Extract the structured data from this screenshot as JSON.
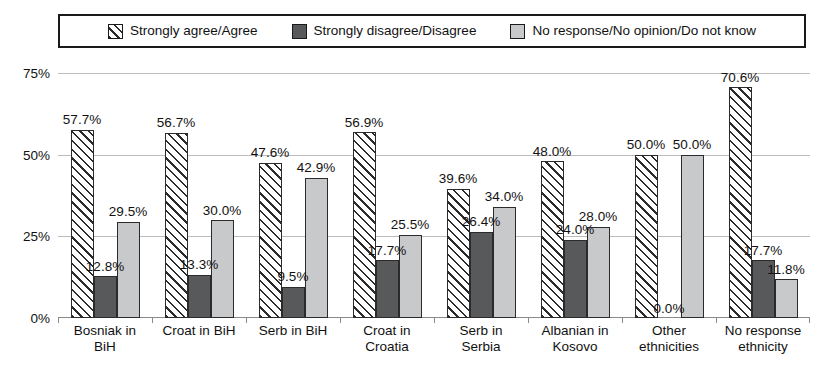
{
  "legend": {
    "items": [
      {
        "label": "Strongly agree/Agree",
        "swatch": "hatch-swatch",
        "color": "#ffffff"
      },
      {
        "label": "Strongly disagree/Disagree",
        "swatch": "dark-gray-swatch",
        "color": "#58595b"
      },
      {
        "label": "No response/No opinion/Do not know",
        "swatch": "light-gray-swatch",
        "color": "#c8c9ca"
      }
    ]
  },
  "axis": {
    "y_ticks": [
      "0%",
      "25%",
      "50%",
      "75%"
    ]
  },
  "chart_data": {
    "type": "bar",
    "title": "",
    "xlabel": "",
    "ylabel": "",
    "ylim": [
      0,
      75
    ],
    "ytick_values": [
      0,
      25,
      50,
      75
    ],
    "grid": true,
    "legend_position": "top",
    "categories": [
      "Bosniak in\nBiH",
      "Croat in BiH",
      "Serb in BiH",
      "Croat in\nCroatia",
      "Serb in\nSerbia",
      "Albanian in\nKosovo",
      "Other\nethnicities",
      "No response\nethnicity"
    ],
    "series": [
      {
        "name": "Strongly agree/Agree",
        "color": "#ffffff",
        "pattern": "diagonal-hatch",
        "values": [
          57.7,
          56.7,
          47.6,
          56.9,
          39.6,
          48.0,
          50.0,
          70.6
        ],
        "labels": [
          "57.7%",
          "56.7%",
          "47.6%",
          "56.9%",
          "39.6%",
          "48.0%",
          "50.0%",
          "70.6%"
        ]
      },
      {
        "name": "Strongly disagree/Disagree",
        "color": "#58595b",
        "pattern": "solid",
        "values": [
          12.8,
          13.3,
          9.5,
          17.7,
          26.4,
          24.0,
          0.0,
          17.7
        ],
        "labels": [
          "12.8%",
          "13.3%",
          "9.5%",
          "17.7%",
          "26.4%",
          "24.0%",
          "0.0%",
          "17.7%"
        ]
      },
      {
        "name": "No response/No opinion/Do not know",
        "color": "#c8c9ca",
        "pattern": "solid",
        "values": [
          29.5,
          30.0,
          42.9,
          25.5,
          34.0,
          28.0,
          50.0,
          11.8
        ],
        "labels": [
          "29.5%",
          "30.0%",
          "42.9%",
          "25.5%",
          "34.0%",
          "28.0%",
          "50.0%",
          "11.8%"
        ]
      }
    ]
  }
}
